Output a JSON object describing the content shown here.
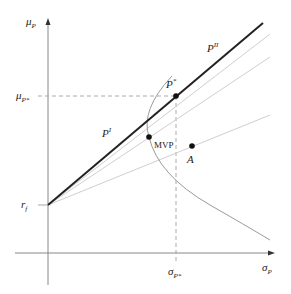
{
  "diagram": {
    "type": "capital-market-line",
    "axes": {
      "y_label": "μ",
      "y_label_sub": "P",
      "x_label": "σ",
      "x_label_sub": "P"
    },
    "ticks": {
      "mu_star": {
        "base": "μ",
        "sub": "P*"
      },
      "sigma_star": {
        "base": "σ",
        "sub": "P*"
      },
      "rf": {
        "base": "r",
        "sub": "f"
      }
    },
    "labels": {
      "p_star": {
        "base": "P",
        "sup": "*"
      },
      "p_one": {
        "base": "P",
        "sup": "I"
      },
      "p_two": {
        "base": "P",
        "sup": "II"
      },
      "mvp": "MVP",
      "a": "A"
    },
    "colors": {
      "axis": "#888888",
      "tangent_line": "#222222",
      "gray_lines": "#c8c8c8",
      "frontier": "#999999",
      "dashed": "#aaaaaa",
      "points": "#111111"
    }
  }
}
